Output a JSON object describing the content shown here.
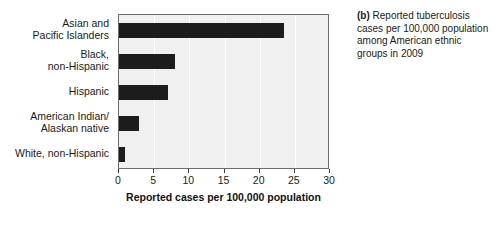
{
  "caption": {
    "tag": "(b)",
    "text": " Reported tuberculosis cases per 100,000 population among American ethnic groups in 2009"
  },
  "chart_data": {
    "type": "bar",
    "orientation": "horizontal",
    "title": "",
    "xlabel": "Reported cases per 100,000 population",
    "ylabel": "",
    "xlim": [
      0,
      30
    ],
    "xticks": [
      0,
      5,
      10,
      15,
      20,
      25,
      30
    ],
    "grid": true,
    "grid_axis": "x",
    "legend": false,
    "bar_color": "#1c1c1c",
    "plot_background": "#f0f0f0",
    "categories": [
      "Asian and\nPacific Islanders",
      "Black,\nnon-Hispanic",
      "Hispanic",
      "American Indian/\nAlaskan native",
      "White, non-Hispanic"
    ],
    "values": [
      23.5,
      7.9,
      7.0,
      2.9,
      0.8
    ],
    "tick_labels": [
      "0",
      "5",
      "10",
      "15",
      "20",
      "25",
      "30"
    ]
  }
}
